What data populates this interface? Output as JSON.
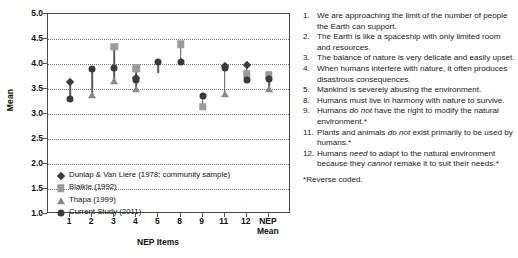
{
  "chart_data": {
    "type": "scatter",
    "title": "",
    "xlabel": "NEP Items",
    "ylabel": "Mean",
    "ylim": [
      1.0,
      5.0
    ],
    "ytick_labels": [
      "5.0",
      "4.5",
      "4.0",
      "3.5",
      "3.0",
      "2.5",
      "2.0",
      "1.5",
      "1.0"
    ],
    "ytick_values": [
      5.0,
      4.5,
      4.0,
      3.5,
      3.0,
      2.5,
      2.0,
      1.5,
      1.0
    ],
    "grid": true,
    "legend_position": "inside-lower-left",
    "categories": [
      "1",
      "2",
      "3",
      "4",
      "5",
      "8",
      "9",
      "11",
      "12",
      "NEP Mean"
    ],
    "series": [
      {
        "name": "Dunlap & Van Liere (1978; community sample)",
        "marker": "diamond",
        "color": "#3e3e3e",
        "values": [
          3.65,
          null,
          null,
          3.72,
          null,
          null,
          null,
          3.97,
          3.98,
          null
        ]
      },
      {
        "name": "Blaikie (1992)",
        "marker": "square",
        "color": "#9a9a9a",
        "values": [
          null,
          null,
          4.35,
          3.92,
          null,
          4.4,
          3.15,
          null,
          3.8,
          3.78
        ]
      },
      {
        "name": "Thapa (1999)",
        "marker": "triangle",
        "color": "#8a8a8a",
        "values": [
          null,
          3.38,
          3.66,
          3.5,
          null,
          null,
          null,
          3.4,
          null,
          3.5
        ]
      },
      {
        "name": "Current Study (2011)",
        "marker": "circle",
        "color": "#3a3a3a",
        "values": [
          3.3,
          3.9,
          3.93,
          3.68,
          4.05,
          4.04,
          3.37,
          3.93,
          3.68,
          3.7
        ]
      }
    ],
    "ranges": [
      {
        "category": "1",
        "low": 3.3,
        "high": 3.65
      },
      {
        "category": "2",
        "low": 3.38,
        "high": 3.9
      },
      {
        "category": "3",
        "low": 3.66,
        "high": 4.35
      },
      {
        "category": "4",
        "low": 3.5,
        "high": 3.92
      },
      {
        "category": "5",
        "low": 3.82,
        "high": 4.05
      },
      {
        "category": "8",
        "low": 4.04,
        "high": 4.4
      },
      {
        "category": "9",
        "low": 3.12,
        "high": 3.37
      },
      {
        "category": "11",
        "low": 3.4,
        "high": 3.97
      },
      {
        "category": "12",
        "low": 3.68,
        "high": 3.98
      },
      {
        "category": "NEP Mean",
        "low": 3.5,
        "high": 3.8
      }
    ]
  },
  "chart": {
    "y_axis_title": "Mean",
    "x_axis_title": "NEP Items",
    "y_ticks": [
      "5.0",
      "4.5",
      "4.0",
      "3.5",
      "3.0",
      "2.5",
      "2.0",
      "1.5",
      "1.0"
    ],
    "x_ticks": [
      "1",
      "2",
      "3",
      "4",
      "5",
      "8",
      "9",
      "11",
      "12",
      "NEP\nMean"
    ],
    "x_tick_last_line1": "NEP",
    "x_tick_last_line2": "Mean",
    "legend": [
      {
        "symbol": "diamond",
        "label": "Dunlap & Van Liere (1978; community sample)"
      },
      {
        "symbol": "square",
        "label": "Blaikie (1992)"
      },
      {
        "symbol": "triangle",
        "label": "Thapa (1999)"
      },
      {
        "symbol": "circle",
        "label": "Current Study (2011)"
      }
    ]
  },
  "items": [
    {
      "num": "1.",
      "html": "We are approaching the limit of the number of people the Earth can support."
    },
    {
      "num": "2.",
      "html": "The Earth is like a spaceship with only limited room and resources."
    },
    {
      "num": "3.",
      "html": "The balance of nature is very delicate and easily upset."
    },
    {
      "num": "4.",
      "html": "When humans interfere with nature, it often produces disastrous consequences."
    },
    {
      "num": "5.",
      "html": "Mankind is severely abusing the environment."
    },
    {
      "num": "8.",
      "html": "Humans must live in harmony with nature to survive."
    },
    {
      "num": "9.",
      "html": "Humans <em>do not</em> have the right to modify the natural environment.*"
    },
    {
      "num": "11.",
      "html": "Plants and animals <em>do not</em> exist primarily to be used by humans.*"
    },
    {
      "num": "12.",
      "html": "Humans <em>need</em> to adapt to the natural environment because they <em>cannot</em> remake it to suit their needs.*"
    }
  ],
  "footnote": "*Reverse coded."
}
